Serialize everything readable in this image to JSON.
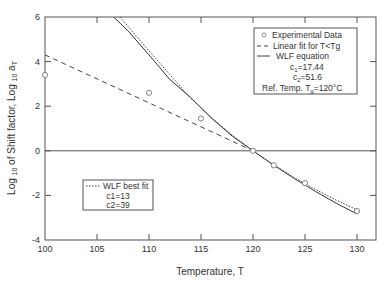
{
  "chart_data": {
    "type": "line",
    "title": "",
    "xlabel": "Temperature, T",
    "ylabel": "Log 10 of Shift factor, Log 10 aT",
    "ylabel_parts": {
      "a": "Log ",
      "b": "10",
      "c": " of Shift factor, Log ",
      "d": "10",
      "e": " a",
      "f": "T"
    },
    "xlim": [
      100,
      130
    ],
    "ylim": [
      -4,
      6
    ],
    "xticks": [
      100,
      105,
      110,
      115,
      120,
      125,
      130
    ],
    "yticks": [
      -4,
      -2,
      0,
      2,
      4,
      6
    ],
    "grid": false,
    "reference_line_y": 0,
    "series": [
      {
        "name": "Experimental Data",
        "style": "open-circle",
        "x": [
          100,
          110,
          115,
          120,
          122,
          125,
          130
        ],
        "y": [
          3.4,
          2.6,
          1.45,
          0.0,
          -0.65,
          -1.45,
          -2.7
        ]
      },
      {
        "name": "Linear fit for T<Tg",
        "style": "dashed",
        "x": [
          100,
          120
        ],
        "y": [
          4.3,
          0.0
        ]
      },
      {
        "name": "WLF equation",
        "style": "solid",
        "c1": 17.44,
        "c2": 51.6,
        "Tref": 120,
        "x": [
          106.6,
          108,
          110,
          112,
          114,
          116,
          118,
          120,
          122,
          124,
          126,
          128,
          130
        ],
        "y": [
          6.0,
          5.37,
          4.3,
          3.2,
          2.39,
          1.47,
          0.66,
          0.0,
          -0.65,
          -1.25,
          -1.82,
          -2.35,
          -2.83
        ]
      },
      {
        "name": "WLF best fit",
        "style": "dotted",
        "c1": 13,
        "c2": 39,
        "Tref": 120,
        "x": [
          107.2,
          108,
          110,
          112,
          114,
          116,
          118,
          120,
          122,
          124,
          126,
          128,
          130
        ],
        "y": [
          6.0,
          5.57,
          4.48,
          3.42,
          2.36,
          1.49,
          0.7,
          0.0,
          -0.63,
          -1.21,
          -1.73,
          -2.21,
          -2.65
        ]
      }
    ],
    "legend_main": {
      "position": "upper right",
      "entries": [
        "Experimental Data",
        "Linear fit for T<Tg",
        "WLF equation"
      ],
      "c1_label": "c",
      "c1_sub": "1",
      "c1_value": "=17.44",
      "c2_label": "c",
      "c2_sub": "2",
      "c2_value": "=51.6",
      "ref_label": "Ref. Temp. T",
      "ref_sub": "g",
      "ref_value": "=120°C"
    },
    "legend_fit": {
      "position": "lower left",
      "entry": "WLF best fit",
      "c1": "c1=13",
      "c2": "c2=39"
    }
  }
}
